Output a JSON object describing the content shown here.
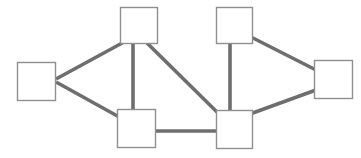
{
  "diagram": {
    "canvas": {
      "width": 361,
      "height": 158,
      "background": "#ffffff"
    },
    "style": {
      "node_fill": "#ffffff",
      "node_stroke": "#8f8f8f",
      "node_stroke_width": 1.4,
      "edge_stroke": "#6e6e6e",
      "edge_stroke_width": 3.6
    },
    "nodes": [
      {
        "id": "A",
        "name": "node-left",
        "label": "",
        "x": 17,
        "y": 62,
        "w": 38,
        "h": 38
      },
      {
        "id": "B",
        "name": "node-top-left",
        "label": "",
        "x": 120,
        "y": 7,
        "w": 37,
        "h": 36
      },
      {
        "id": "C",
        "name": "node-top-right",
        "label": "",
        "x": 216,
        "y": 7,
        "w": 36,
        "h": 36
      },
      {
        "id": "D",
        "name": "node-bottom-left",
        "label": "",
        "x": 117,
        "y": 109,
        "w": 38,
        "h": 38
      },
      {
        "id": "E",
        "name": "node-bottom-right",
        "label": "",
        "x": 216,
        "y": 110,
        "w": 36,
        "h": 38
      },
      {
        "id": "F",
        "name": "node-right",
        "label": "",
        "x": 314,
        "y": 60,
        "w": 38,
        "h": 38
      }
    ],
    "edges": [
      {
        "id": "A-B",
        "name": "edge-left-to-top-left",
        "from": "A",
        "to": "B",
        "x1": 56,
        "y1": 79,
        "x2": 124,
        "y2": 42
      },
      {
        "id": "A-D",
        "name": "edge-left-to-bottom-left",
        "from": "A",
        "to": "D",
        "x1": 56,
        "y1": 82,
        "x2": 121,
        "y2": 118
      },
      {
        "id": "B-D",
        "name": "edge-top-left-to-bottom-left",
        "from": "B",
        "to": "D",
        "x1": 133,
        "y1": 42,
        "x2": 133,
        "y2": 114
      },
      {
        "id": "B-E",
        "name": "edge-top-left-to-bottom-right",
        "from": "B",
        "to": "E",
        "x1": 146,
        "y1": 42,
        "x2": 219,
        "y2": 114
      },
      {
        "id": "C-E",
        "name": "edge-top-right-to-bottom-right",
        "from": "C",
        "to": "E",
        "x1": 230,
        "y1": 42,
        "x2": 230,
        "y2": 114
      },
      {
        "id": "C-F",
        "name": "edge-top-right-to-right",
        "from": "C",
        "to": "F",
        "x1": 249,
        "y1": 36,
        "x2": 316,
        "y2": 70
      },
      {
        "id": "D-E",
        "name": "edge-bottom-left-to-bottom-right",
        "from": "D",
        "to": "E",
        "x1": 151,
        "y1": 131,
        "x2": 219,
        "y2": 131
      },
      {
        "id": "E-F",
        "name": "edge-bottom-right-to-right",
        "from": "E",
        "to": "F",
        "x1": 250,
        "y1": 114,
        "x2": 316,
        "y2": 90
      }
    ]
  },
  "chart_data": {
    "type": "diagram",
    "node_count": 6,
    "edge_count": 8,
    "node_ids": [
      "A",
      "B",
      "C",
      "D",
      "E",
      "F"
    ],
    "adjacency": [
      [
        "A",
        "B"
      ],
      [
        "A",
        "D"
      ],
      [
        "B",
        "D"
      ],
      [
        "B",
        "E"
      ],
      [
        "C",
        "E"
      ],
      [
        "C",
        "F"
      ],
      [
        "D",
        "E"
      ],
      [
        "E",
        "F"
      ]
    ],
    "degrees": {
      "A": 2,
      "B": 3,
      "C": 2,
      "D": 3,
      "E": 4,
      "F": 2
    }
  }
}
